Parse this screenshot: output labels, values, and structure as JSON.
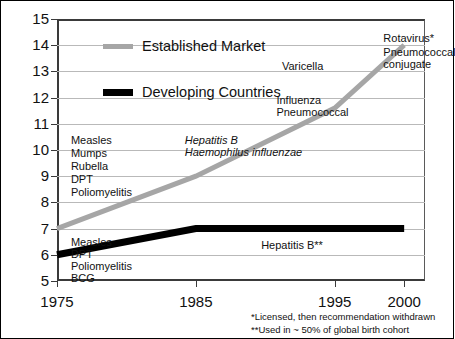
{
  "chart_data": {
    "type": "line",
    "title": "",
    "xlabel": "",
    "ylabel": "",
    "xlim": [
      1975,
      2001.5
    ],
    "ylim": [
      5,
      15
    ],
    "grid": true,
    "legend_position": "upper-left-inside",
    "x_tick_values": [
      1975,
      1985,
      1995,
      2000
    ],
    "x_tick_labels": [
      "1975",
      "1985",
      "1995",
      "2000"
    ],
    "y_tick_values": [
      5,
      6,
      7,
      8,
      9,
      10,
      11,
      12,
      13,
      14,
      15
    ],
    "y_tick_labels": [
      "5",
      "6",
      "7",
      "8",
      "9",
      "10",
      "11",
      "12",
      "13",
      "14",
      "15"
    ],
    "series": [
      {
        "name": "Established Market",
        "color": "#a6a6a6",
        "line_width": 5,
        "x": [
          1975,
          1985,
          1995,
          2000
        ],
        "y": [
          7,
          9,
          11.6,
          14
        ]
      },
      {
        "name": "Developing Countries",
        "color": "#000000",
        "line_width": 7,
        "x": [
          1975,
          1985,
          1995,
          2000
        ],
        "y": [
          6,
          7,
          7,
          7
        ]
      }
    ],
    "annotations": [
      {
        "text": "Measles",
        "x": 1976.0,
        "y": 10.35,
        "italic": false,
        "align": "left"
      },
      {
        "text": "Mumps",
        "x": 1976.0,
        "y": 9.85,
        "italic": false,
        "align": "left"
      },
      {
        "text": "Rubella",
        "x": 1976.0,
        "y": 9.35,
        "italic": false,
        "align": "left"
      },
      {
        "text": "DPT",
        "x": 1976.0,
        "y": 8.85,
        "italic": false,
        "align": "left"
      },
      {
        "text": "Poliomyelitis",
        "x": 1976.0,
        "y": 8.35,
        "italic": false,
        "align": "left"
      },
      {
        "text": "Measles",
        "x": 1976.0,
        "y": 6.45,
        "italic": false,
        "align": "left"
      },
      {
        "text": "DPT",
        "x": 1976.0,
        "y": 5.98,
        "italic": false,
        "align": "left"
      },
      {
        "text": "Poliomyelitis",
        "x": 1976.0,
        "y": 5.52,
        "italic": false,
        "align": "left"
      },
      {
        "text": "BCG",
        "x": 1976.0,
        "y": 5.08,
        "italic": false,
        "align": "left"
      },
      {
        "text": "Hepatitis B",
        "x": 1984.2,
        "y": 10.35,
        "italic": true,
        "align": "left"
      },
      {
        "text": "Haemophilus influenzae",
        "x": 1984.2,
        "y": 9.88,
        "italic": true,
        "align": "left"
      },
      {
        "text": "Influenza",
        "x": 1990.8,
        "y": 11.88,
        "italic": false,
        "align": "left"
      },
      {
        "text": "Pneumococcal",
        "x": 1990.8,
        "y": 11.4,
        "italic": false,
        "align": "left"
      },
      {
        "text": "Varicella",
        "x": 1991.2,
        "y": 13.18,
        "italic": false,
        "align": "left"
      },
      {
        "text": "Rotavirus*",
        "x": 1998.5,
        "y": 14.22,
        "italic": false,
        "align": "left"
      },
      {
        "text": "Pneumococcal",
        "x": 1998.5,
        "y": 13.72,
        "italic": false,
        "align": "left"
      },
      {
        "text": "conjugate",
        "x": 1998.5,
        "y": 13.24,
        "italic": false,
        "align": "left"
      },
      {
        "text": "Hepatitis B**",
        "x": 1989.7,
        "y": 6.35,
        "italic": false,
        "align": "left"
      }
    ],
    "footnotes": [
      "*Licensed, then recommendation withdrawn",
      "**Used in ~ 50% of global birth cohort"
    ]
  },
  "legend": {
    "items": [
      {
        "label": "Established Market",
        "swatch": "established"
      },
      {
        "label": "Developing Countries",
        "swatch": "developing"
      }
    ]
  }
}
